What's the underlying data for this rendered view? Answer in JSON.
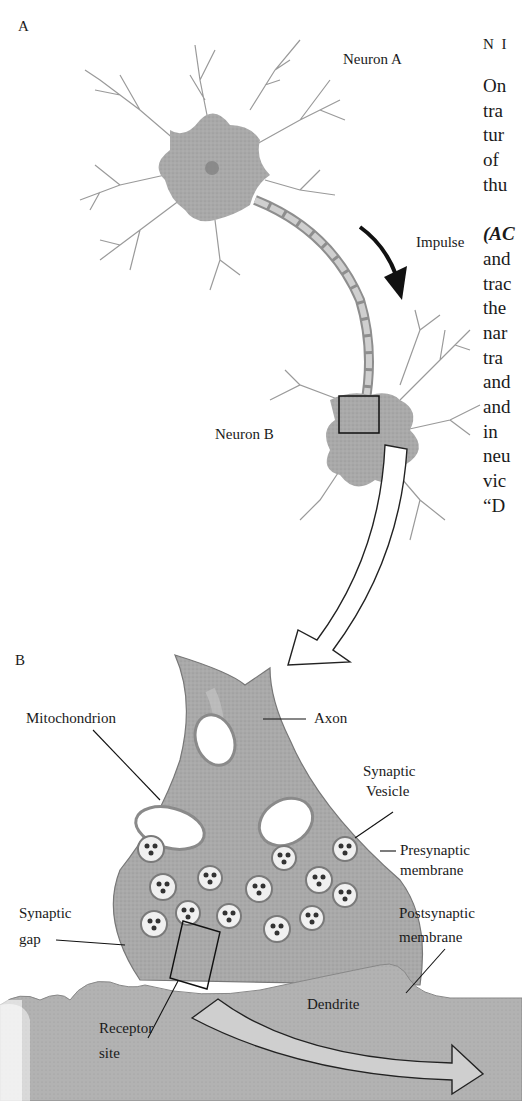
{
  "figure": {
    "panel_a": {
      "label": "A",
      "labels": {
        "neuron_a": "Neuron A",
        "impulse": "Impulse",
        "neuron_b": "Neuron B"
      }
    },
    "panel_b": {
      "label": "B",
      "labels": {
        "mitochondrion": "Mitochondrion",
        "axon": "Axon",
        "synaptic_vesicle_1": "Synaptic",
        "synaptic_vesicle_2": "Vesicle",
        "presynaptic_1": "Presynaptic",
        "presynaptic_2": "membrane",
        "synaptic_gap_1": "Synaptic",
        "synaptic_gap_2": "gap",
        "postsynaptic_1": "Postsynaptic",
        "postsynaptic_2": "membrane",
        "dendrite": "Dendrite",
        "receptor_1": "Receptor",
        "receptor_2": "site"
      }
    }
  },
  "page_text": {
    "heading_fragment": "N I",
    "lines": [
      "On",
      "tra",
      "tur",
      "of",
      "thu",
      "",
      "(AC",
      "and",
      "trac",
      "the",
      "nar",
      "tra",
      "and",
      "and",
      "in",
      "neu",
      "vic",
      "“D"
    ]
  }
}
